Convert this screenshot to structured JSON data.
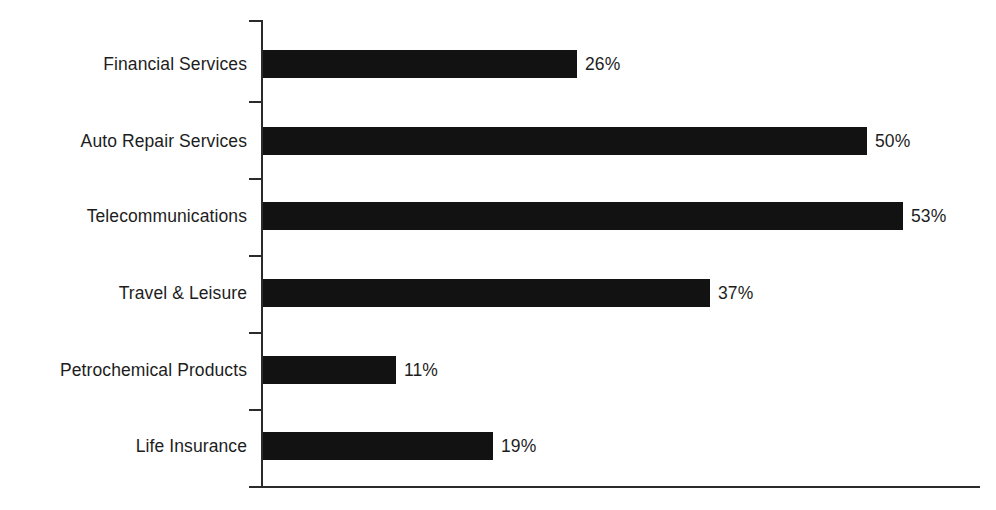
{
  "chart_data": {
    "type": "bar",
    "orientation": "horizontal",
    "title": "",
    "subtitle": "",
    "xlabel": "",
    "ylabel": "",
    "grid": false,
    "legend": null,
    "xlim": [
      0,
      59
    ],
    "categories": [
      "Financial Services",
      "Auto Repair Services",
      "Telecommunications",
      "Travel & Leisure",
      "Petrochemical Products",
      "Life Insurance"
    ],
    "values": [
      26,
      50,
      53,
      37,
      11,
      19
    ],
    "value_labels": [
      "26%",
      "50%",
      "53%",
      "37%",
      "11%",
      "19%"
    ],
    "bar_color": "#121212",
    "axis_color": "#2b2b2b",
    "background_color": "#ffffff",
    "text_color": "#1d1d1d"
  },
  "bars": [
    {
      "label": "Financial Services",
      "value": 26,
      "value_label": "26%"
    },
    {
      "label": "Auto Repair Services",
      "value": 50,
      "value_label": "50%"
    },
    {
      "label": "Telecommunications",
      "value": 53,
      "value_label": "53%"
    },
    {
      "label": "Travel & Leisure",
      "value": 37,
      "value_label": "37%"
    },
    {
      "label": "Petrochemical Products",
      "value": 11,
      "value_label": "11%"
    },
    {
      "label": "Life Insurance",
      "value": 19,
      "value_label": "19%"
    }
  ]
}
